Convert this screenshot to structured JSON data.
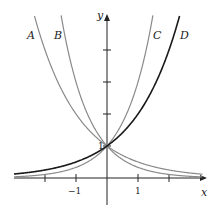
{
  "chart_data": {
    "type": "line",
    "title": "",
    "xlabel": "x",
    "ylabel": "y",
    "xlim": [
      -3,
      3.1
    ],
    "ylim": [
      -0.8,
      5.1
    ],
    "grid": false,
    "x_ticks": [
      -2,
      -1,
      1,
      2
    ],
    "x_tick_labels": [
      "-1",
      "1"
    ],
    "y_ticks": [
      1,
      2,
      3,
      4
    ],
    "y_tick_labels": [
      "1"
    ],
    "series": [
      {
        "name": "A",
        "function": "2^(-x)",
        "color": "#8a8a8a"
      },
      {
        "name": "B",
        "function": "3^(-x)",
        "color": "#8a8a8a"
      },
      {
        "name": "C",
        "function": "3^x",
        "color": "#8a8a8a"
      },
      {
        "name": "D",
        "function": "2^x",
        "color": "#1a1a1a"
      }
    ],
    "annotations": [
      "All curves pass through (0, 1)"
    ]
  },
  "labels": {
    "x_axis": "x",
    "y_axis": "y",
    "neg_one": "−1",
    "one_x": "1",
    "one_y": "1",
    "A": "A",
    "B": "B",
    "C": "C",
    "D": "D"
  }
}
